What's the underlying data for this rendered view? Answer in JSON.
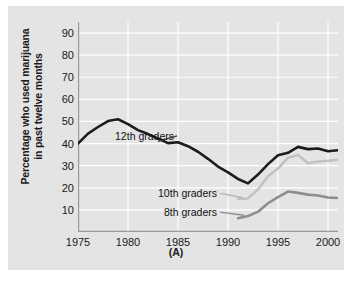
{
  "figure": {
    "caption": "(A)",
    "ylabel_line1": "Percentage who used marijuana",
    "ylabel_line2": "in past twelve months"
  },
  "chart_data": {
    "type": "line",
    "title": "",
    "xlabel": "",
    "ylabel": "Percentage who used marijuana in past twelve months",
    "xlim": [
      1975,
      2001
    ],
    "ylim": [
      0,
      95
    ],
    "yticks": [
      10,
      20,
      30,
      40,
      50,
      60,
      70,
      80,
      90
    ],
    "xticks": [
      1975,
      1980,
      1985,
      1990,
      1995,
      2000
    ],
    "grid": "white gridlines on gray panel",
    "legend": "inline labels with leader lines",
    "colors": {
      "grade12": "#1c1c1c",
      "grade10": "#c2c2c2",
      "grade8": "#8d8d8d",
      "panel": "#e4e4e4",
      "gridline": "#ffffff",
      "text": "#1a1a1a"
    },
    "series": [
      {
        "name": "12th graders",
        "color": "#1c1c1c",
        "label_x": 1984.6,
        "label_y": 43.5,
        "x": [
          1975,
          1976,
          1977,
          1978,
          1979,
          1980,
          1981,
          1982,
          1983,
          1984,
          1985,
          1986,
          1987,
          1988,
          1989,
          1990,
          1991,
          1992,
          1993,
          1994,
          1995,
          1996,
          1997,
          1998,
          1999,
          2000,
          2001
        ],
        "y": [
          40,
          44.5,
          47.5,
          50.2,
          51,
          48.8,
          46.1,
          44.3,
          42.3,
          40.2,
          40.6,
          38.8,
          36.3,
          33.1,
          29.6,
          27,
          24,
          22,
          26,
          30.7,
          34.7,
          35.8,
          38.5,
          37.5,
          37.8,
          36.5,
          37
        ]
      },
      {
        "name": "10th graders",
        "color": "#c2c2c2",
        "label_x": 1988.9,
        "label_y": 17.5,
        "x": [
          1991,
          1992,
          1993,
          1994,
          1995,
          1996,
          1997,
          1998,
          1999,
          2000,
          2001
        ],
        "y": [
          15,
          15.2,
          19.2,
          25.2,
          28.7,
          33.6,
          34.8,
          31.1,
          31.9,
          32.2,
          32.7
        ]
      },
      {
        "name": "8th graders",
        "color": "#8d8d8d",
        "label_x": 1988.9,
        "label_y": 9.0,
        "x": [
          1991,
          1992,
          1993,
          1994,
          1995,
          1996,
          1997,
          1998,
          1999,
          2000,
          2001
        ],
        "y": [
          6.2,
          7.2,
          9.2,
          13,
          15.8,
          18.3,
          17.7,
          16.9,
          16.5,
          15.6,
          15.4
        ]
      }
    ]
  }
}
